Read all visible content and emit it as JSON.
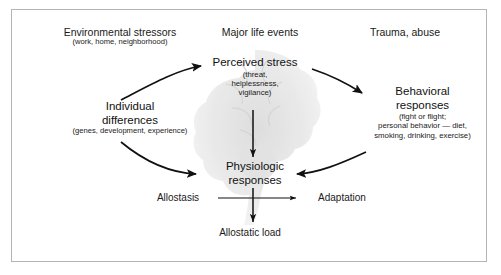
{
  "figure": {
    "background_color": "#ffffff",
    "border_color": "#b4b4b4",
    "text_color": "#1a1a1a"
  },
  "nodes": {
    "environmental_stressors": {
      "title": "Environmental stressors",
      "detail": "(work, home, neighborhood)"
    },
    "major_life_events": {
      "title": "Major life events"
    },
    "trauma_abuse": {
      "title": "Trauma, abuse"
    },
    "perceived_stress": {
      "title": "Perceived stress",
      "detail_line1": "(threat,",
      "detail_line2": "helplessness,",
      "detail_line3": "vigilance)"
    },
    "individual_differences": {
      "title_line1": "Individual",
      "title_line2": "differences",
      "detail": "(genes, development, experience)"
    },
    "behavioral_responses": {
      "title_line1": "Behavioral",
      "title_line2": "responses",
      "detail_line1": "(fight or flight;",
      "detail_line2": "personal behavior — diet,",
      "detail_line3": "smoking, drinking, exercise)"
    },
    "physiologic_responses": {
      "title_line1": "Physiologic",
      "title_line2": "responses"
    },
    "allostasis": {
      "title": "Allostasis"
    },
    "adaptation": {
      "title": "Adaptation"
    },
    "allostatic_load": {
      "title": "Allostatic load"
    }
  },
  "connections": [
    {
      "name": "individual-differences-to-perceived-stress",
      "style": "curved-arrow"
    },
    {
      "name": "perceived-stress-to-behavioral-responses",
      "style": "curved-arrow"
    },
    {
      "name": "individual-differences-to-physiologic-responses",
      "style": "curved-arrow"
    },
    {
      "name": "behavioral-responses-to-physiologic-responses",
      "style": "curved-arrow"
    },
    {
      "name": "perceived-stress-to-physiologic-responses",
      "style": "straight-arrow-down"
    },
    {
      "name": "allostasis-to-adaptation",
      "style": "straight-arrow-right"
    },
    {
      "name": "physiologic-responses-to-allostatic-load",
      "style": "straight-arrow-down"
    }
  ],
  "decorative": {
    "brain_illustration": "brain-watermark"
  }
}
